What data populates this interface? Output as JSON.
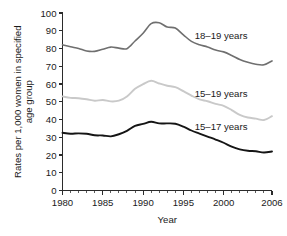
{
  "chart_data": {
    "type": "line",
    "title": "",
    "xlabel": "Year",
    "ylabel": "Rates per 1,000 women in specified age group",
    "xlim": [
      1980,
      2006
    ],
    "ylim": [
      0,
      100
    ],
    "grid": false,
    "legend_position": "inline-right",
    "y_ticks": [
      "0",
      "10",
      "20",
      "30",
      "40",
      "50",
      "60",
      "70",
      "80",
      "90",
      "100"
    ],
    "x_ticks": [
      "1980",
      "1985",
      "1990",
      "1995",
      "2000",
      "2006"
    ],
    "x_minor_tick_step": 1,
    "x": [
      1980,
      1981,
      1982,
      1983,
      1984,
      1985,
      1986,
      1987,
      1988,
      1989,
      1990,
      1991,
      1992,
      1993,
      1994,
      1995,
      1996,
      1997,
      1998,
      1999,
      2000,
      2001,
      2002,
      2003,
      2004,
      2005,
      2006
    ],
    "series": [
      {
        "name": "18–19 years",
        "label": "18–19 years",
        "color": "#6f6f6f",
        "width": 1.6,
        "values": [
          82.1,
          81.0,
          80.0,
          78.6,
          78.4,
          79.6,
          80.8,
          80.2,
          79.9,
          84.2,
          88.6,
          94.0,
          94.5,
          92.1,
          91.5,
          87.7,
          84.0,
          82.1,
          80.9,
          79.1,
          78.1,
          76.1,
          73.8,
          72.2,
          71.1,
          70.8,
          73.0
        ]
      },
      {
        "name": "15–19 years",
        "label": "15–19 years",
        "color": "#c9c9c9",
        "width": 1.9,
        "values": [
          53.0,
          52.2,
          52.0,
          51.4,
          50.6,
          51.0,
          50.2,
          50.6,
          53.0,
          57.3,
          59.9,
          61.8,
          60.3,
          59.0,
          58.2,
          56.0,
          53.5,
          51.3,
          50.3,
          48.8,
          47.7,
          45.3,
          42.6,
          41.1,
          40.5,
          39.7,
          41.9
        ]
      },
      {
        "name": "15–17 years",
        "label": "15–17 years",
        "color": "#151515",
        "width": 1.9,
        "values": [
          32.5,
          32.0,
          32.2,
          32.0,
          31.1,
          31.0,
          30.5,
          31.7,
          33.6,
          36.4,
          37.5,
          38.7,
          37.8,
          37.8,
          37.6,
          36.0,
          33.8,
          32.1,
          30.4,
          28.7,
          26.9,
          24.7,
          23.2,
          22.4,
          22.1,
          21.4,
          22.0
        ]
      }
    ],
    "annotations": [
      {
        "text": "18–19 years",
        "x": 1996.4,
        "y": 87.5
      },
      {
        "text": "15–19 years",
        "x": 1996.4,
        "y": 54.5
      },
      {
        "text": "15–17 years",
        "x": 1996.4,
        "y": 36.0
      }
    ]
  }
}
